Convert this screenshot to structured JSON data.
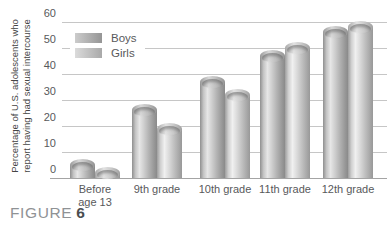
{
  "caption": {
    "prefix": "FIGURE",
    "number": "6"
  },
  "y_axis": {
    "title_line1": "Percentage of U.S. adolescents who",
    "title_line2": "report having had sexual intercourse"
  },
  "legend": {
    "items": [
      {
        "label": "Boys"
      },
      {
        "label": "Girls"
      }
    ]
  },
  "chart_data": {
    "type": "bar",
    "bar_style": "3d-cylinder",
    "title": "",
    "xlabel": "",
    "ylabel": "Percentage of U.S. adolescents who report having had sexual intercourse",
    "categories": [
      "Before age 13",
      "9th grade",
      "10th grade",
      "11th grade",
      "12th grade"
    ],
    "series": [
      {
        "name": "Boys",
        "values": [
          5,
          26,
          37,
          47,
          56
        ]
      },
      {
        "name": "Girls",
        "values": [
          2,
          19,
          32,
          50,
          58
        ]
      }
    ],
    "ylim": [
      0,
      60
    ],
    "yticks": [
      0,
      10,
      20,
      30,
      40,
      50,
      60
    ],
    "grid": true,
    "legend_position": "top-left",
    "colors": {
      "boys_bar": "#b9b9b9",
      "girls_bar": "#cfcfcf",
      "gridline": "#c6c6c6",
      "text": "#58595b"
    }
  }
}
